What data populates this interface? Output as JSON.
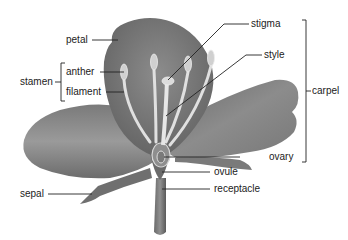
{
  "diagram": {
    "colors": {
      "petal_dark": "#6e6e6e",
      "petal_mid": "#8a8a8a",
      "petal_light": "#a4a4a4",
      "stamen": "#e4e4e4",
      "leader_line": "#222222",
      "text": "#222222",
      "background": "#ffffff"
    },
    "labels": {
      "petal": "petal",
      "anther": "anther",
      "filament": "filament",
      "stamen": "stamen",
      "stigma": "stigma",
      "style": "style",
      "carpel": "carpel",
      "ovary": "ovary",
      "ovule": "ovule",
      "receptacle": "receptacle",
      "sepal": "sepal"
    },
    "groups": [
      {
        "name": "stamen",
        "members": [
          "anther",
          "filament"
        ]
      },
      {
        "name": "carpel",
        "members": [
          "stigma",
          "style",
          "ovary"
        ]
      }
    ]
  }
}
